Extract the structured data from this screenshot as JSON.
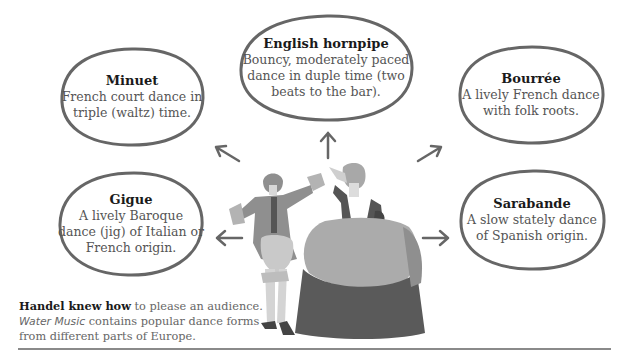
{
  "dances": [
    {
      "id": "minuet",
      "title": "Minuet",
      "desc": "French court dance in triple (waltz) time.",
      "line1": "French court dance in",
      "line2": "triple (waltz) time."
    },
    {
      "id": "english-hornpipe",
      "title": "English hornpipe",
      "line1": "Bouncy, moderately paced",
      "line2": "dance in duple time (two",
      "line3": "beats to the bar)."
    },
    {
      "id": "bourree",
      "title": "Bourrée",
      "line1": "A lively French dance",
      "line2": "with folk roots."
    },
    {
      "id": "gigue",
      "title": "Gigue",
      "line1": "A lively Baroque",
      "line2": "dance (jig) of Italian or",
      "line3": "French origin."
    },
    {
      "id": "sarabande",
      "title": "Sarabande",
      "line1": "A slow stately dance",
      "line2": "of Spanish origin."
    }
  ],
  "caption": {
    "bold": "Handel knew how",
    "text1": " to please an audience.",
    "italic": "Water Music",
    "text2": " contains popular dance forms",
    "text3": "from different parts of Europe."
  },
  "colors": {
    "outline": "#666666",
    "figure_dark": "#5a5a5a",
    "figure_mid": "#8c8c8c",
    "figure_light": "#b3b3b3",
    "rule": "#8a8a8a"
  }
}
